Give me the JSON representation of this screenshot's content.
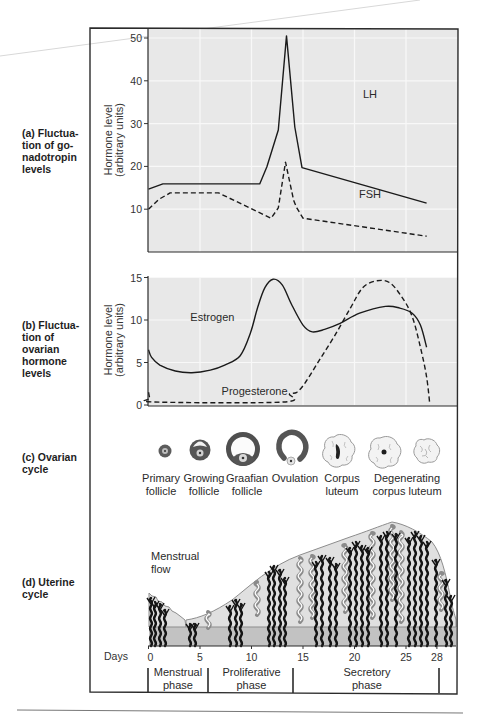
{
  "panels": {
    "a": {
      "label": "(a) Fluctua-\ntion of go-\nnadotropin\nlevels"
    },
    "b": {
      "label": "(b) Fluctua-\ntion of\novarian\nhormone\nlevels"
    },
    "c": {
      "label": "(c) Ovarian\ncycle"
    },
    "d": {
      "label": "(d) Uterine\ncycle"
    }
  },
  "ovarian_stages": [
    {
      "id": "primary",
      "line1": "Primary",
      "line2": "follicle"
    },
    {
      "id": "growing",
      "line1": "Growing",
      "line2": "follicle"
    },
    {
      "id": "graafian",
      "line1": "Graafian",
      "line2": "follicle"
    },
    {
      "id": "ovulation",
      "line1": "Ovulation",
      "line2": ""
    },
    {
      "id": "corpus-luteum",
      "line1": "Corpus",
      "line2": "luteum"
    },
    {
      "id": "degenerating",
      "line1": "Degenerating",
      "line2": "corpus luteum"
    }
  ],
  "uterine": {
    "annotation_line1": "Menstrual",
    "annotation_line2": "flow"
  },
  "days_axis": {
    "label": "Days",
    "ticks": [
      0,
      5,
      10,
      15,
      20,
      25,
      28
    ]
  },
  "phases": [
    {
      "line1": "Menstrual",
      "line2": "phase",
      "start": 0,
      "end": 5.8
    },
    {
      "line1": "Proliferative",
      "line2": "phase",
      "start": 5.8,
      "end": 14
    },
    {
      "line1": "Secretory",
      "line2": "phase",
      "start": 14,
      "end": 28.2
    }
  ],
  "colors": {
    "plot_bg": "#e8e8e8",
    "grid": "#f8f8f8",
    "line": "#1a1a1a",
    "frame": "#2b2b2b",
    "tissue": "#e0e0e0",
    "basal": "#c2c2c2",
    "artery": "#141414",
    "gland": "#8a8a8a"
  },
  "chart_data": [
    {
      "type": "line",
      "title": "(a) Fluctuation of gonadotropin levels",
      "xlabel": "Days",
      "ylabel": "Hormone level (arbitrary units)",
      "xlim": [
        0,
        28
      ],
      "ylim": [
        0,
        50
      ],
      "yticks": [
        10,
        20,
        30,
        40,
        50
      ],
      "grid": true,
      "series": [
        {
          "name": "LH",
          "style": "solid",
          "label_pos": [
            21.5,
            37
          ],
          "points": [
            [
              0,
              14.7
            ],
            [
              1.4,
              15.9
            ],
            [
              10.8,
              15.9
            ],
            [
              11.5,
              19.9
            ],
            [
              12.6,
              28.5
            ],
            [
              13.4,
              50.5
            ],
            [
              14.2,
              29.2
            ],
            [
              14.9,
              19.7
            ],
            [
              27.0,
              11.4
            ]
          ]
        },
        {
          "name": "FSH",
          "style": "dashed",
          "label_pos": [
            21.5,
            13.5
          ],
          "points": [
            [
              0,
              10.0
            ],
            [
              1.0,
              12.3
            ],
            [
              2.1,
              13.8
            ],
            [
              6.8,
              13.8
            ],
            [
              11.9,
              7.9
            ],
            [
              12.6,
              10.3
            ],
            [
              13.3,
              21.0
            ],
            [
              14.1,
              12.0
            ],
            [
              14.4,
              10.3
            ],
            [
              15.0,
              7.9
            ],
            [
              27.0,
              3.7
            ]
          ]
        }
      ]
    },
    {
      "type": "line",
      "title": "(b) Fluctuation of ovarian hormone levels",
      "xlabel": "Days",
      "ylabel": "Hormone level (arbitrary units)",
      "xlim": [
        0,
        28
      ],
      "ylim": [
        0,
        15
      ],
      "yticks": [
        0,
        5,
        10,
        15
      ],
      "grid": true,
      "series": [
        {
          "name": "Estrogen",
          "style": "solid",
          "label_pos": [
            6.2,
            10.3
          ],
          "points": [
            [
              0,
              6.5
            ],
            [
              0.3,
              5.6
            ],
            [
              1.1,
              4.7
            ],
            [
              2.6,
              4.0
            ],
            [
              4.2,
              3.8
            ],
            [
              6.0,
              4.1
            ],
            [
              7.4,
              4.7
            ],
            [
              8.9,
              5.8
            ],
            [
              9.9,
              8.5
            ],
            [
              10.6,
              11.5
            ],
            [
              11.3,
              13.8
            ],
            [
              12.1,
              14.8
            ],
            [
              13.0,
              14.1
            ],
            [
              13.9,
              11.8
            ],
            [
              15.0,
              9.4
            ],
            [
              15.9,
              8.6
            ],
            [
              17.1,
              8.9
            ],
            [
              18.6,
              9.6
            ],
            [
              20.5,
              10.8
            ],
            [
              23.0,
              11.6
            ],
            [
              24.4,
              11.4
            ],
            [
              25.6,
              10.8
            ],
            [
              26.4,
              9.4
            ],
            [
              27.0,
              6.8
            ]
          ]
        },
        {
          "name": "Progesterone",
          "style": "dashed",
          "label_pos": [
            10.3,
            1.7
          ],
          "points": [
            [
              0,
              1.5
            ],
            [
              0.15,
              0.8
            ],
            [
              0.6,
              0.35
            ],
            [
              13.1,
              0.35
            ],
            [
              13.7,
              1.3
            ],
            [
              14.4,
              1.5
            ],
            [
              15.2,
              2.6
            ],
            [
              16.6,
              5.3
            ],
            [
              18.1,
              8.2
            ],
            [
              19.6,
              11.4
            ],
            [
              20.8,
              13.8
            ],
            [
              22.1,
              14.6
            ],
            [
              23.4,
              14.4
            ],
            [
              24.6,
              12.7
            ],
            [
              25.6,
              10.4
            ],
            [
              26.4,
              6.8
            ],
            [
              27.0,
              3.3
            ],
            [
              27.3,
              0.2
            ]
          ]
        }
      ]
    }
  ]
}
